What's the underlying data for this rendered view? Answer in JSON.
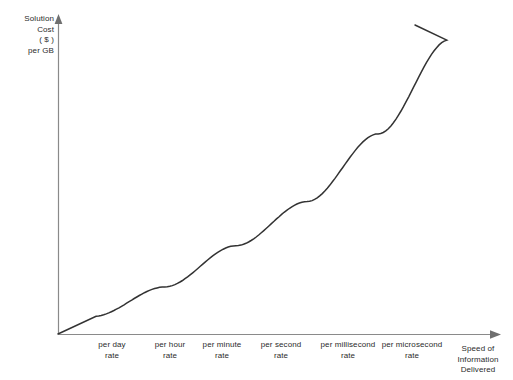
{
  "chart_data": {
    "type": "line",
    "title": "",
    "subtitle": "",
    "xlabel": "Speed of\nInformation\nDelivered",
    "ylabel": "Solution\nCost\n( $ )\nper GB",
    "grid": false,
    "legend": null,
    "categories": [
      "per day\nrate",
      "per hour\nrate",
      "per minute\nrate",
      "per second\nrate",
      "per millisecond\nrate",
      "per microsecond\nrate"
    ],
    "x": [
      0,
      1,
      2,
      3,
      4,
      5
    ],
    "values": [
      0.06,
      0.16,
      0.3,
      0.45,
      0.68,
      1.0
    ],
    "xlim": [
      -0.5,
      5.6
    ],
    "ylim": [
      0,
      1.05
    ],
    "annotations": [],
    "series": [
      {
        "name": "Solution cost per GB vs. speed of information delivered",
        "values": [
          0.06,
          0.16,
          0.3,
          0.45,
          0.68,
          1.0
        ],
        "color": "#333333"
      }
    ],
    "axis_color": "#8a8a8a",
    "curve_color": "#333333",
    "background_color": "#ffffff"
  },
  "axes": {
    "y_title": "Solution\nCost\n( $ )\nper GB",
    "x_title": "Speed of\nInformation\nDelivered"
  },
  "ticks": {
    "x": [
      {
        "label": "per day\nrate",
        "left": 88,
        "width": 48
      },
      {
        "label": "per hour\nrate",
        "left": 145,
        "width": 50
      },
      {
        "label": "per minute\nrate",
        "left": 194,
        "width": 56
      },
      {
        "label": "per second\nrate",
        "left": 253,
        "width": 56
      },
      {
        "label": "per millisecond\nrate",
        "left": 312,
        "width": 72
      },
      {
        "label": "per microsecond\nrate",
        "left": 374,
        "width": 76
      }
    ]
  }
}
